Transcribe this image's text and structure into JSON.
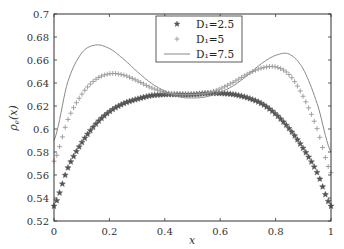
{
  "chart_data": {
    "type": "line",
    "title": "",
    "xlabel": "x",
    "ylabel": "ρ_e(x)",
    "xlim": [
      0,
      1
    ],
    "ylim": [
      0.52,
      0.7
    ],
    "xticks": [
      "0",
      "0.2",
      "0.4",
      "0.6",
      "0.8",
      "1"
    ],
    "yticks": [
      "0.52",
      "0.54",
      "0.56",
      "0.58",
      "0.6",
      "0.62",
      "0.64",
      "0.66",
      "0.68",
      "0.7"
    ],
    "grid": false,
    "legend_position": "upper center",
    "x": [
      0,
      0.05,
      0.1,
      0.15,
      0.2,
      0.25,
      0.3,
      0.35,
      0.4,
      0.45,
      0.5,
      0.55,
      0.6,
      0.65,
      0.7,
      0.75,
      0.8,
      0.85,
      0.9,
      0.95,
      1
    ],
    "series": [
      {
        "name": "D1=2.5",
        "legend_label": "D₁=2.5",
        "marker": "star",
        "color": "#555555",
        "values": [
          0.533,
          0.566,
          0.588,
          0.604,
          0.615,
          0.622,
          0.626,
          0.629,
          0.63,
          0.63,
          0.63,
          0.631,
          0.631,
          0.63,
          0.627,
          0.622,
          0.613,
          0.6,
          0.583,
          0.562,
          0.533
        ]
      },
      {
        "name": "D1=5",
        "legend_label": "D₁=5",
        "marker": "plus",
        "color": "#999999",
        "values": [
          0.572,
          0.608,
          0.63,
          0.643,
          0.648,
          0.647,
          0.642,
          0.636,
          0.632,
          0.63,
          0.63,
          0.631,
          0.635,
          0.641,
          0.648,
          0.653,
          0.654,
          0.647,
          0.628,
          0.6,
          0.562
        ]
      },
      {
        "name": "D1=7.5",
        "legend_label": "D₁=7.5",
        "marker": "line",
        "color": "#888888",
        "values": [
          0.59,
          0.641,
          0.666,
          0.673,
          0.67,
          0.661,
          0.65,
          0.64,
          0.633,
          0.628,
          0.627,
          0.628,
          0.632,
          0.638,
          0.647,
          0.657,
          0.664,
          0.665,
          0.652,
          0.622,
          0.58
        ]
      }
    ]
  }
}
